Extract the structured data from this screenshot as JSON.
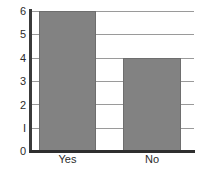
{
  "chart_data": {
    "type": "bar",
    "title": "",
    "subtitle": "",
    "xlabel": "",
    "ylabel": "",
    "categories": [
      "Yes",
      "No"
    ],
    "values": [
      6,
      4
    ],
    "series": [
      {
        "name": "Count",
        "values": [
          6,
          4
        ]
      }
    ],
    "ylim": [
      0,
      6
    ],
    "y_ticks": [
      0,
      1,
      2,
      3,
      4,
      5,
      6
    ],
    "y_tick_labels": [
      "0",
      "I",
      "2",
      "3",
      "4",
      "5",
      "6"
    ],
    "grid": "horizontal",
    "legend": "none",
    "bar_color": "#828282",
    "bar_outline_color": "#6e6e6e",
    "gridline_color": "#9a9a9a",
    "axis_color": "#2e2e2e",
    "text_color": "#2b2b2b",
    "background": "#ffffff"
  }
}
